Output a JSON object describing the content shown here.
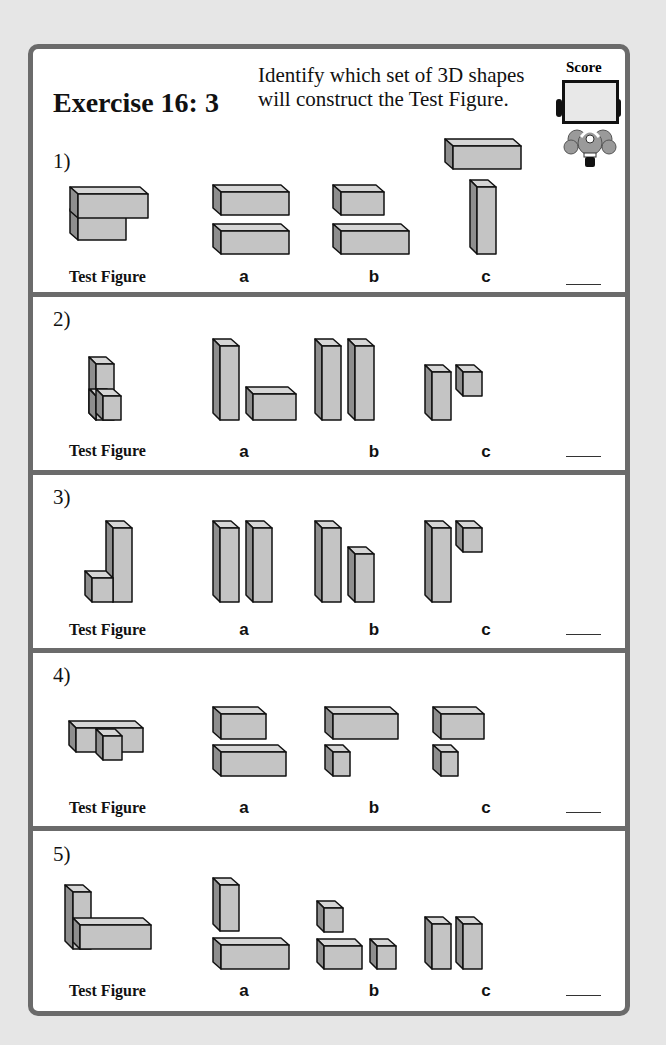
{
  "header": {
    "title": "Exercise 16: 3",
    "instruction_line1": "Identify which set of 3D shapes",
    "instruction_line2": "will construct the Test Figure.",
    "score_label": "Score"
  },
  "labels": {
    "test_figure": "Test Figure",
    "option_a": "a",
    "option_b": "b",
    "option_c": "c"
  },
  "questions": [
    {
      "number": "1)",
      "answer_blank": ""
    },
    {
      "number": "2)",
      "answer_blank": ""
    },
    {
      "number": "3)",
      "answer_blank": ""
    },
    {
      "number": "4)",
      "answer_blank": ""
    },
    {
      "number": "5)",
      "answer_blank": ""
    }
  ],
  "colors": {
    "frame": "#6b6b6b",
    "box_front": "#c4c4c4",
    "box_top": "#d6d6d6",
    "box_side": "#8e8e8e",
    "background": "#e6e6e6"
  }
}
